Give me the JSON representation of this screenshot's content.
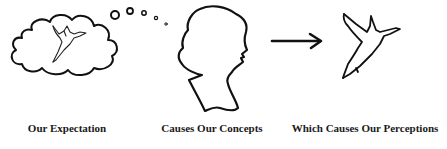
{
  "diagram": {
    "stroke_color": "#111111",
    "background": "#ffffff",
    "panels": [
      {
        "id": "expectation",
        "icon": "thought-cloud-with-hummingbird-icon",
        "label": "Our Expectation"
      },
      {
        "id": "concepts",
        "icon": "woman-head-silhouette-icon",
        "label": "Causes Our Concepts"
      },
      {
        "id": "perceptions",
        "icon": "hummingbird-icon",
        "label": "Which Causes Our Perceptions"
      }
    ],
    "connector": {
      "icon": "right-arrow-icon"
    }
  }
}
